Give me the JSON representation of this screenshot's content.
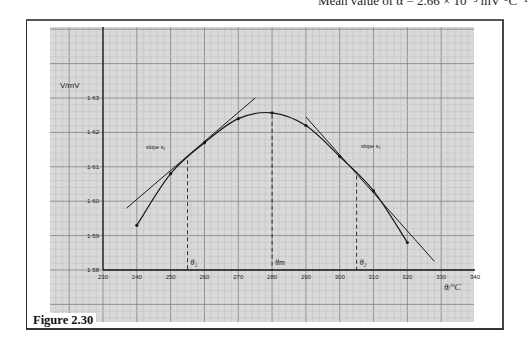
{
  "header_text": "Mean value of α = 2.66 × 10⁻³ mV °C⁻¹",
  "caption": "Figure 2.30",
  "colors": {
    "paper": "#d9d9d9",
    "grid_minor": "#bdbdbd",
    "grid_major": "#8a8a8a",
    "ink": "#1a1a1a"
  },
  "chart_data": {
    "type": "line",
    "title": "",
    "xlabel": "θ/°C",
    "ylabel": "V/mV",
    "xlim": [
      230,
      340
    ],
    "ylim": [
      1.58,
      1.63
    ],
    "x_ticks": [
      230,
      240,
      250,
      260,
      270,
      280,
      290,
      300,
      310,
      320,
      330,
      340
    ],
    "y_ticks": [
      "1.58",
      "1.59",
      "1.60",
      "1.61",
      "1.62",
      "1.63"
    ],
    "grid": true,
    "series": [
      {
        "name": "thermocouple e.m.f.",
        "x": [
          240,
          250,
          260,
          270,
          280,
          290,
          300,
          310,
          320
        ],
        "values": [
          1.593,
          1.608,
          1.617,
          1.624,
          1.6257,
          1.622,
          1.613,
          1.603,
          1.588
        ]
      }
    ],
    "tangents": [
      {
        "label": "slope s₁",
        "from": [
          237,
          1.598
        ],
        "to": [
          275,
          1.63
        ]
      },
      {
        "label": "slope s₂",
        "from": [
          290,
          1.6245
        ],
        "to": [
          328,
          1.5825
        ]
      }
    ],
    "markers": [
      {
        "label": "θ₁",
        "x": 255
      },
      {
        "label": "θm",
        "x": 280
      },
      {
        "label": "θ₂",
        "x": 305
      }
    ],
    "annotations": [
      "slope s₁",
      "slope s₂"
    ]
  }
}
